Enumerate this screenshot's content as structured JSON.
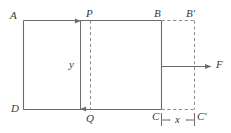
{
  "figure": {
    "stroke_color": "#6b6b6b",
    "dash_color": "#8a8a8a",
    "label_color": "#3a3a3a",
    "background_color": "#ffffff",
    "vertices": {
      "A": "A",
      "B": "B",
      "C": "C",
      "D": "D",
      "B_prime": "B′",
      "C_prime": "C′",
      "P": "P",
      "Q": "Q"
    },
    "dimensions": {
      "height_label": "y",
      "shift_label": "x"
    },
    "force": {
      "label": "F"
    }
  }
}
